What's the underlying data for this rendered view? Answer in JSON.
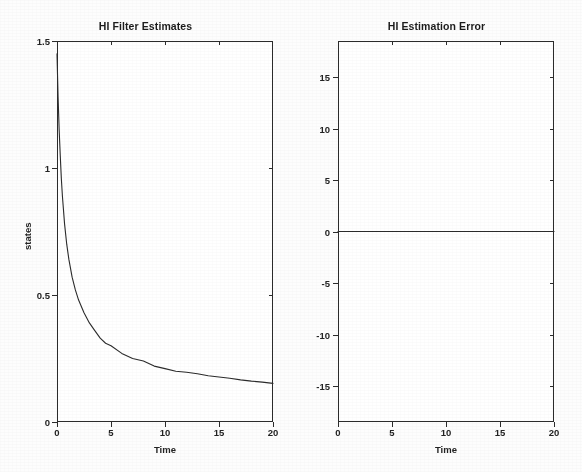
{
  "figure": {
    "background_color": "#fdfdfd",
    "line_color": "#2b2b2b",
    "text_color": "#232323"
  },
  "panels": {
    "left": {
      "title": "HI Filter Estimates",
      "xlabel": "Time",
      "ylabel": "states",
      "xticks": [
        "0",
        "5",
        "10",
        "15",
        "20"
      ],
      "yticks": [
        "0",
        "0.5",
        "1",
        "1.5"
      ]
    },
    "right": {
      "title": "HI Estimation Error",
      "xlabel": "Time",
      "ylabel": "",
      "xticks": [
        "0",
        "5",
        "10",
        "15",
        "20"
      ],
      "yticks": [
        "-15",
        "-10",
        "-5",
        "0",
        "5",
        "10",
        "15"
      ]
    }
  },
  "chart_data": [
    {
      "type": "line",
      "title": "HI Filter Estimates",
      "xlabel": "Time",
      "ylabel": "states",
      "xlim": [
        0,
        20
      ],
      "ylim": [
        0,
        1.5
      ],
      "xticks": [
        0,
        5,
        10,
        15,
        20
      ],
      "yticks": [
        0,
        0.5,
        1,
        1.5
      ],
      "grid": false,
      "legend": null,
      "series": [
        {
          "name": "state estimate",
          "color": "#2b2b2b",
          "x": [
            0,
            0.1,
            0.2,
            0.3,
            0.4,
            0.5,
            0.7,
            0.9,
            1.1,
            1.4,
            1.7,
            2.0,
            2.5,
            3.0,
            3.5,
            4.0,
            4.5,
            5.0,
            6.0,
            7.0,
            8.0,
            9.0,
            10.0,
            11.0,
            12.0,
            13.0,
            14.0,
            15.0,
            16.0,
            17.0,
            18.0,
            19.0,
            20.0
          ],
          "y": [
            1.45,
            1.28,
            1.15,
            1.05,
            0.96,
            0.89,
            0.78,
            0.7,
            0.64,
            0.57,
            0.52,
            0.48,
            0.43,
            0.39,
            0.36,
            0.33,
            0.31,
            0.3,
            0.27,
            0.25,
            0.24,
            0.22,
            0.21,
            0.2,
            0.196,
            0.19,
            0.182,
            0.177,
            0.172,
            0.166,
            0.161,
            0.157,
            0.152
          ]
        }
      ]
    },
    {
      "type": "line",
      "title": "HI Estimation Error",
      "xlabel": "Time",
      "ylabel": "",
      "xlim": [
        0,
        20
      ],
      "ylim": [
        -18.5,
        18.5
      ],
      "xticks": [
        0,
        5,
        10,
        15,
        20
      ],
      "yticks": [
        -15,
        -10,
        -5,
        0,
        5,
        10,
        15
      ],
      "grid": false,
      "legend": null,
      "series": [
        {
          "name": "estimation error",
          "color": "#2b2b2b",
          "x": [
            0,
            5,
            10,
            15,
            20
          ],
          "y": [
            0,
            0,
            0,
            0,
            0
          ]
        }
      ]
    }
  ]
}
